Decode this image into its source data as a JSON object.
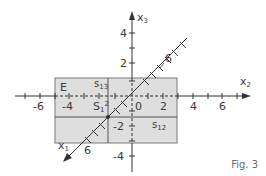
{
  "figure": {
    "caption": "Fig. 3",
    "colors": {
      "plane_fill": "#dedede",
      "plane_stroke": "#6a6a6a",
      "axis": "#333333",
      "trace": "#555555"
    },
    "axes": {
      "x1": {
        "name": "x",
        "index": "1",
        "tick_label": "6"
      },
      "x2": {
        "name": "x",
        "index": "2",
        "tick_labels": [
          "-6",
          "-4",
          "2",
          "4",
          "6"
        ],
        "origin": "0"
      },
      "x3": {
        "name": "x",
        "index": "3",
        "tick_labels": [
          "4",
          "2",
          "-2",
          "-4"
        ]
      },
      "x1_upper_tick_label": "6"
    },
    "plane_label": "E",
    "traces": {
      "s13": {
        "base": "s",
        "index": "13"
      },
      "s12": {
        "base": "s",
        "index": "12"
      },
      "S1": {
        "base": "S",
        "index": "1",
        "sup": "2"
      }
    },
    "extra_tick_label": "-4"
  }
}
